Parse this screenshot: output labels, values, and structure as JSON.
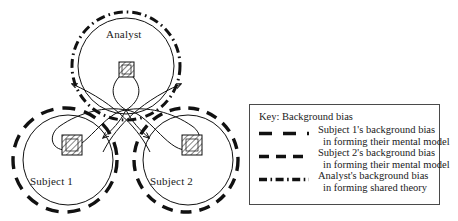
{
  "figure": {
    "nodes": [
      {
        "id": "analyst",
        "label": "Analyst"
      },
      {
        "id": "subject1",
        "label": "Subject 1"
      },
      {
        "id": "subject2",
        "label": "Subject 2"
      }
    ]
  },
  "legend": {
    "title": "Key: Background bias",
    "entries": [
      {
        "style": "dashed-long",
        "line1": "Subject 1's background bias",
        "line2": "in forming their mental model"
      },
      {
        "style": "dashed-medium",
        "line1": "Subject 2's background bias",
        "line2": "in forming their mental model"
      },
      {
        "style": "dash-dot",
        "line1": "Analyst's background bias",
        "line2": "in forming shared theory"
      }
    ]
  },
  "colors": {
    "ink": "#1a1a1a",
    "stroke": "#111111",
    "legend_border": "#4a4a4a",
    "background": "#ffffff"
  }
}
